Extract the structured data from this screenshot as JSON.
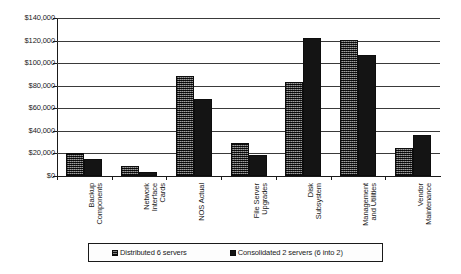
{
  "chart_data": {
    "type": "bar",
    "title": "",
    "xlabel": "",
    "ylabel": "",
    "ylim": [
      0,
      140000
    ],
    "ytick_labels": [
      "$140,000",
      "$120,000",
      "$100,000",
      "$80,000",
      "$60,000",
      "$40,000",
      "$20,000",
      "$0"
    ],
    "ytick_values": [
      140000,
      120000,
      100000,
      80000,
      60000,
      40000,
      20000,
      0
    ],
    "grid": true,
    "legend_position": "bottom",
    "categories": [
      "Backup\nComponents",
      "Network\nInterface\nCards",
      "NOS Actual",
      "File Server\nUpgrades",
      "Disk\nSubsystem",
      "Management\nand Utilities",
      "Vendor\nMaintenance"
    ],
    "series": [
      {
        "name": "Distributed 6 servers",
        "color": "#4a4a4a",
        "values": [
          20500,
          8500,
          89000,
          29500,
          83000,
          120500,
          24500
        ]
      },
      {
        "name": "Consolidated 2 servers (6 into 2)",
        "color": "#141414",
        "values": [
          15500,
          3500,
          68500,
          18500,
          122500,
          107000,
          36000
        ]
      }
    ]
  },
  "legend": {
    "entries": [
      {
        "label": "Distributed 6 servers"
      },
      {
        "label": "Consolidated 2 servers (6 into 2)"
      }
    ]
  }
}
